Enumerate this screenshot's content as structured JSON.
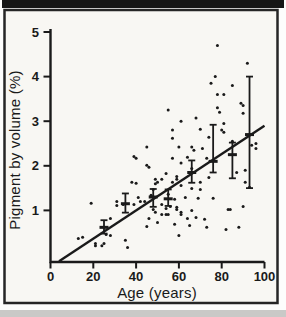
{
  "chart_data": {
    "type": "scatter",
    "title": "",
    "xlabel": "Age (years)",
    "ylabel": "Pigment by volume (%)",
    "xlim": [
      0,
      100
    ],
    "ylim": [
      0,
      5
    ],
    "xticks": [
      0,
      20,
      40,
      60,
      80,
      100
    ],
    "yticks": [
      1,
      2,
      3,
      4,
      5
    ],
    "grid": false,
    "legend": "none",
    "points": [
      [
        13,
        0.37
      ],
      [
        15,
        0.4
      ],
      [
        19,
        1.16
      ],
      [
        21,
        0.21
      ],
      [
        21,
        0.26
      ],
      [
        24,
        0.21
      ],
      [
        25,
        0.26
      ],
      [
        26,
        0.46
      ],
      [
        28,
        0.44
      ],
      [
        28,
        0.82
      ],
      [
        31,
        1.11
      ],
      [
        31,
        1.2
      ],
      [
        34,
        1.13
      ],
      [
        35,
        0.33
      ],
      [
        36,
        0.17
      ],
      [
        38,
        1.63
      ],
      [
        39,
        1.13
      ],
      [
        39,
        2.21
      ],
      [
        40,
        1.61
      ],
      [
        40,
        2.17
      ],
      [
        41,
        1.29
      ],
      [
        42,
        1.2
      ],
      [
        44,
        1.2
      ],
      [
        45,
        0.64
      ],
      [
        45,
        2.01
      ],
      [
        45,
        2.42
      ],
      [
        46,
        0.82
      ],
      [
        46,
        1.97
      ],
      [
        47,
        1.34
      ],
      [
        48,
        1.02
      ],
      [
        48,
        1.47
      ],
      [
        49,
        0.96
      ],
      [
        49,
        1.6
      ],
      [
        49,
        1.7
      ],
      [
        50,
        0.73
      ],
      [
        50,
        1.63
      ],
      [
        52,
        0.91
      ],
      [
        52,
        1.13
      ],
      [
        52,
        1.7
      ],
      [
        54,
        0.91
      ],
      [
        54,
        1.04
      ],
      [
        54,
        1.83
      ],
      [
        55,
        0.91
      ],
      [
        55,
        1.36
      ],
      [
        55,
        3.25
      ],
      [
        56,
        1.09
      ],
      [
        57,
        1.63
      ],
      [
        57,
        2.17
      ],
      [
        57,
        2.62
      ],
      [
        57,
        2.8
      ],
      [
        58,
        0.69
      ],
      [
        58,
        1.25
      ],
      [
        59,
        1.02
      ],
      [
        59,
        1.07
      ],
      [
        59,
        1.7
      ],
      [
        59,
        1.76
      ],
      [
        60,
        0.44
      ],
      [
        60,
        2.42
      ],
      [
        61,
        0.91
      ],
      [
        61,
        0.96
      ],
      [
        61,
        1.56
      ],
      [
        61,
        2.06
      ],
      [
        61,
        3.0
      ],
      [
        63,
        1.29
      ],
      [
        64,
        0.82
      ],
      [
        64,
        2.19
      ],
      [
        65,
        0.66
      ],
      [
        66,
        1.0
      ],
      [
        66,
        1.49
      ],
      [
        66,
        1.94
      ],
      [
        66,
        2.42
      ],
      [
        67,
        2.35
      ],
      [
        68,
        0.84
      ],
      [
        68,
        3.07
      ],
      [
        69,
        1.27
      ],
      [
        70,
        1.47
      ],
      [
        70,
        1.63
      ],
      [
        70,
        2.82
      ],
      [
        71,
        2.39
      ],
      [
        72,
        0.8
      ],
      [
        73,
        0.62
      ],
      [
        73,
        2.17
      ],
      [
        74,
        1.74
      ],
      [
        74,
        2.64
      ],
      [
        75,
        3.85
      ],
      [
        76,
        1.27
      ],
      [
        77,
        4.0
      ],
      [
        78,
        3.3
      ],
      [
        78,
        3.6
      ],
      [
        78,
        4.7
      ],
      [
        79,
        3.2
      ],
      [
        80,
        2.8
      ],
      [
        81,
        2.75
      ],
      [
        81,
        2.95
      ],
      [
        81,
        3.6
      ],
      [
        82,
        0.57
      ],
      [
        83,
        1.02
      ],
      [
        84,
        1.02
      ],
      [
        85,
        2.55
      ],
      [
        85,
        3.8
      ],
      [
        87,
        1.85
      ],
      [
        88,
        0.62
      ],
      [
        89,
        3.4
      ],
      [
        90,
        1.09
      ],
      [
        90,
        3.18
      ],
      [
        90,
        3.35
      ],
      [
        91,
        1.63
      ],
      [
        91,
        1.9
      ],
      [
        92,
        4.3
      ],
      [
        93,
        1.52
      ],
      [
        94,
        2.46
      ],
      [
        96,
        2.39
      ],
      [
        96,
        2.5
      ]
    ],
    "error_bars": [
      {
        "age": 25,
        "mean": 0.62,
        "low": 0.48,
        "high": 0.78
      },
      {
        "age": 35,
        "mean": 1.15,
        "low": 0.95,
        "high": 1.38
      },
      {
        "age": 48,
        "mean": 1.3,
        "low": 1.08,
        "high": 1.48
      },
      {
        "age": 55,
        "mean": 1.26,
        "low": 1.1,
        "high": 1.47
      },
      {
        "age": 66,
        "mean": 1.85,
        "low": 1.62,
        "high": 2.12
      },
      {
        "age": 76,
        "mean": 2.1,
        "low": 1.85,
        "high": 2.92
      },
      {
        "age": 85,
        "mean": 2.25,
        "low": 1.72,
        "high": 2.52
      },
      {
        "age": 93,
        "mean": 2.7,
        "low": 1.5,
        "high": 4.0
      }
    ],
    "regression_line": {
      "x1": 4,
      "y1": -0.14,
      "x2": 100,
      "y2": 2.9
    },
    "colors": {
      "ink": "#1a1a1a",
      "paper": "#f8f7f3",
      "scan_bar": "#161616",
      "frame": "#262626",
      "bottom_strip": "#c9c9c7"
    }
  }
}
